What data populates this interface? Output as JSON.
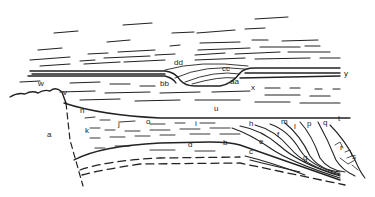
{
  "diagram": {
    "type": "geological-cross-section",
    "labels": [
      {
        "id": "a",
        "text": "a",
        "x": 47,
        "y": 137
      },
      {
        "id": "b",
        "text": "b",
        "x": 223,
        "y": 145
      },
      {
        "id": "c",
        "text": "c",
        "x": 249,
        "y": 154
      },
      {
        "id": "d",
        "text": "d",
        "x": 188,
        "y": 147
      },
      {
        "id": "e",
        "text": "e",
        "x": 259,
        "y": 144
      },
      {
        "id": "f",
        "text": "f",
        "x": 277,
        "y": 137
      },
      {
        "id": "g",
        "text": "g",
        "x": 303,
        "y": 160
      },
      {
        "id": "h",
        "text": "h",
        "x": 249,
        "y": 126
      },
      {
        "id": "i",
        "text": "i",
        "x": 195,
        "y": 126
      },
      {
        "id": "j",
        "text": "j",
        "x": 118,
        "y": 126
      },
      {
        "id": "k",
        "text": "k",
        "x": 85,
        "y": 133
      },
      {
        "id": "l",
        "text": "l",
        "x": 294,
        "y": 129
      },
      {
        "id": "m",
        "text": "m",
        "x": 281,
        "y": 124
      },
      {
        "id": "n",
        "text": "n",
        "x": 80,
        "y": 113
      },
      {
        "id": "o",
        "text": "o",
        "x": 146,
        "y": 124
      },
      {
        "id": "p",
        "text": "p",
        "x": 307,
        "y": 126
      },
      {
        "id": "q",
        "text": "q",
        "x": 323,
        "y": 125
      },
      {
        "id": "r",
        "text": "r",
        "x": 340,
        "y": 150
      },
      {
        "id": "s",
        "text": "s",
        "x": 352,
        "y": 159
      },
      {
        "id": "t",
        "text": "t",
        "x": 338,
        "y": 121
      },
      {
        "id": "u",
        "text": "u",
        "x": 214,
        "y": 111
      },
      {
        "id": "v",
        "text": "v",
        "x": 63,
        "y": 95
      },
      {
        "id": "w",
        "text": "w",
        "x": 38,
        "y": 86
      },
      {
        "id": "x",
        "text": "x",
        "x": 251,
        "y": 90
      },
      {
        "id": "y",
        "text": "y",
        "x": 344,
        "y": 76
      },
      {
        "id": "aa",
        "text": "aa",
        "x": 230,
        "y": 84
      },
      {
        "id": "bb",
        "text": "bb",
        "x": 160,
        "y": 86
      },
      {
        "id": "cc",
        "text": "cc",
        "x": 222,
        "y": 71
      },
      {
        "id": "dd",
        "text": "dd",
        "x": 174,
        "y": 65
      }
    ]
  }
}
